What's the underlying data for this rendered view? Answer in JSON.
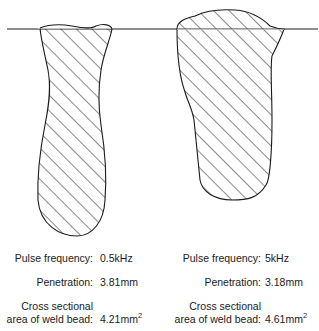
{
  "figure": {
    "type": "weld bead cross-section comparison",
    "line_color": "#1a1a1a",
    "hatch_color": "#1a1a1a",
    "background": "#ffffff"
  },
  "left": {
    "name": "weld-bead-0.5khz",
    "pulse_frequency_label": "Pulse frequency:",
    "pulse_frequency_value": "0.5kHz",
    "penetration_label": "Penetration:",
    "penetration_value": "3.81mm",
    "area_label_line1": "Cross sectional",
    "area_label_line2": "area of weld bead:",
    "area_value": "4.21mm",
    "area_unit_sup": "2"
  },
  "right": {
    "name": "weld-bead-5khz",
    "pulse_frequency_label": "Pulse frequency:",
    "pulse_frequency_value": "5kHz",
    "penetration_label": "Penetration:",
    "penetration_value": "3.18mm",
    "area_label_line1": "Cross sectional",
    "area_label_line2": "area of weld bead:",
    "area_value": "4.61mm",
    "area_unit_sup": "2"
  }
}
